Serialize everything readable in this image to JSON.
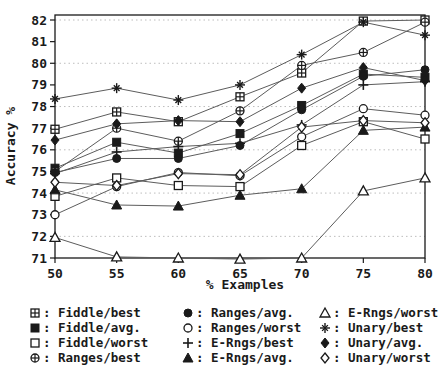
{
  "figure": {
    "background": "#ffffff",
    "ink_color": "#1a1a1a",
    "series_line_color": "#5c5c5c",
    "grid_color": "#bdbdbd"
  },
  "chart_data": {
    "type": "line",
    "title": "",
    "xlabel": "% Examples",
    "ylabel": "Accuracy %",
    "x": [
      50,
      55,
      60,
      65,
      70,
      75,
      80
    ],
    "xticks": [
      50,
      55,
      60,
      65,
      70,
      75,
      80
    ],
    "yticks": [
      71,
      72,
      73,
      74,
      75,
      76,
      77,
      78,
      79,
      80,
      81,
      82
    ],
    "grid_yticks": [
      72,
      74,
      76,
      78,
      80,
      82
    ],
    "xlim": [
      50,
      80
    ],
    "ylim": [
      71,
      82
    ],
    "grid": "dotted-horizontal",
    "legend_position": "bottom",
    "legend_separator": ": ",
    "series": [
      {
        "name": "Fiddle/best",
        "marker": "square-plus-icon",
        "values": [
          76.95,
          77.75,
          77.3,
          78.45,
          79.55,
          81.95,
          82.0
        ]
      },
      {
        "name": "Fiddle/avg.",
        "marker": "filled-square-icon",
        "values": [
          75.15,
          76.35,
          75.85,
          76.75,
          78.05,
          79.5,
          79.35
        ]
      },
      {
        "name": "Fiddle/worst",
        "marker": "open-square-icon",
        "values": [
          73.85,
          74.7,
          74.35,
          74.3,
          76.2,
          77.3,
          76.5
        ]
      },
      {
        "name": "Ranges/best",
        "marker": "circle-plus-icon",
        "values": [
          75.0,
          77.0,
          76.4,
          77.8,
          79.9,
          80.5,
          81.9
        ]
      },
      {
        "name": "Ranges/avg.",
        "marker": "filled-circle-icon",
        "values": [
          74.95,
          75.6,
          75.6,
          76.2,
          77.85,
          79.4,
          79.7
        ]
      },
      {
        "name": "Ranges/worst",
        "marker": "open-circle-icon",
        "values": [
          73.0,
          74.3,
          74.95,
          74.8,
          76.6,
          77.9,
          77.6
        ]
      },
      {
        "name": "E-Rngs/best",
        "marker": "plus-icon",
        "values": [
          74.9,
          75.9,
          76.15,
          76.3,
          77.15,
          79.0,
          79.15
        ]
      },
      {
        "name": "E-Rngs/avg.",
        "marker": "filled-triangle-icon",
        "values": [
          74.15,
          73.45,
          73.4,
          73.9,
          74.2,
          76.9,
          77.05
        ]
      },
      {
        "name": "E-Rngs/worst",
        "marker": "open-triangle-icon",
        "values": [
          71.95,
          71.05,
          71.0,
          70.95,
          71.0,
          74.1,
          74.7
        ]
      },
      {
        "name": "Unary/best",
        "marker": "asterisk-icon",
        "values": [
          78.35,
          78.85,
          78.3,
          79.0,
          80.4,
          81.9,
          81.3
        ]
      },
      {
        "name": "Unary/avg.",
        "marker": "filled-diamond-icon",
        "values": [
          76.45,
          77.2,
          77.35,
          77.3,
          78.85,
          79.8,
          79.2
        ]
      },
      {
        "name": "Unary/worst",
        "marker": "open-diamond-icon",
        "values": [
          74.5,
          74.35,
          74.9,
          74.85,
          77.05,
          77.35,
          77.25
        ]
      }
    ]
  }
}
